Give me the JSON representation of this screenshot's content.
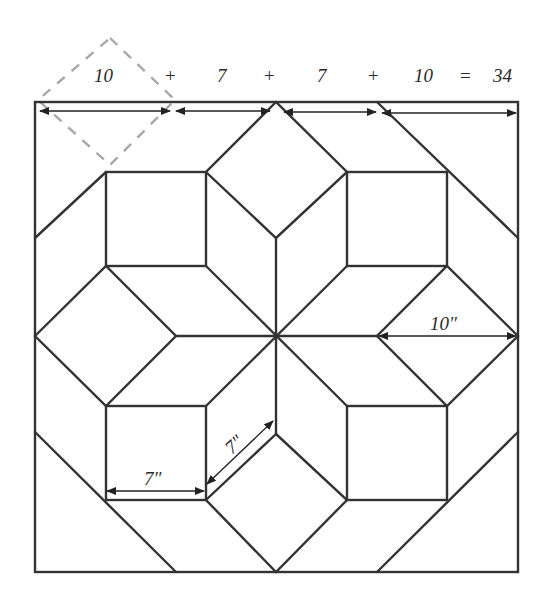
{
  "diagram": {
    "type": "quilt-block-layout",
    "equation": {
      "terms": [
        "10",
        "7",
        "7",
        "10"
      ],
      "operators": [
        "+",
        "+",
        "+",
        "="
      ],
      "total": "34"
    },
    "labels": {
      "right_diamond_width": "10″",
      "square_width": "7″",
      "rhombus_side": "7″"
    },
    "colors": {
      "line": "#333333",
      "dashed_guide": "#a8a8a8",
      "background": "#ffffff"
    }
  }
}
